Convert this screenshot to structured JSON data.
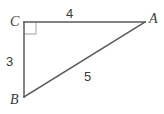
{
  "figure": {
    "type": "right-triangle-diagram",
    "background_color": "#ffffff",
    "stroke_color": "#5a5a5a",
    "right_angle_marker_color": "#bfbfbf",
    "text_color": "#3a3a3a",
    "vertices": [
      {
        "name": "C",
        "label": "C",
        "x": 24,
        "y": 22
      },
      {
        "name": "A",
        "label": "A",
        "x": 145,
        "y": 22
      },
      {
        "name": "B",
        "label": "B",
        "x": 24,
        "y": 97
      }
    ],
    "sides": [
      {
        "name": "CA",
        "label": "4",
        "from": "C",
        "to": "A",
        "length": 4
      },
      {
        "name": "CB",
        "label": "3",
        "from": "C",
        "to": "B",
        "length": 3
      },
      {
        "name": "BA",
        "label": "5",
        "from": "B",
        "to": "A",
        "length": 5
      }
    ],
    "right_angle": {
      "at_vertex": "C",
      "marker_size": 12
    }
  }
}
